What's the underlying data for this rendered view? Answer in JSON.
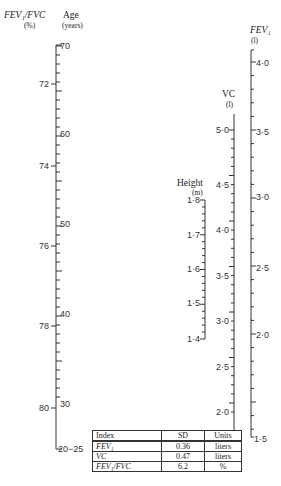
{
  "axes": {
    "fev_fvc": {
      "title": "FEV₁/FVC",
      "unit": "(%)",
      "labels": [
        "72",
        "74",
        "76",
        "78",
        "80"
      ]
    },
    "age": {
      "title": "Age",
      "unit": "(years)",
      "labels": [
        "70",
        "60",
        "50",
        "40",
        "30",
        "20−25"
      ]
    },
    "height": {
      "title": "Height",
      "unit": "(m)",
      "labels": [
        "1·8",
        "1·7",
        "1·6",
        "1·5",
        "1·4"
      ]
    },
    "vc": {
      "title": "VC",
      "unit": "(l)",
      "labels": [
        "5·0",
        "4·5",
        "4·0",
        "3·5",
        "3·0",
        "2·5",
        "2·0"
      ]
    },
    "fev1": {
      "title": "FEV₁",
      "unit": "(l)",
      "labels": [
        "4·0",
        "3·5",
        "3·0",
        "2·5",
        "2·0",
        "1·5"
      ]
    }
  },
  "sd_table": {
    "headers": [
      "Index",
      "SD",
      "Units"
    ],
    "rows": [
      {
        "index": "FEV₁",
        "sd": "0.36",
        "units": "liters"
      },
      {
        "index": "VC",
        "sd": "0.47",
        "units": "liters"
      },
      {
        "index": "FEV₁/FVC",
        "sd": "6.2",
        "units": "%"
      }
    ]
  }
}
